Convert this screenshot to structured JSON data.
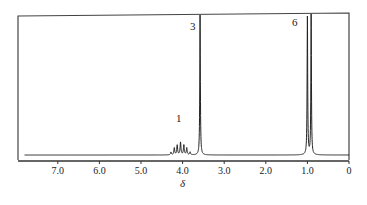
{
  "chart_data": {
    "type": "line",
    "title": "",
    "xlabel": "δ",
    "ylabel": "",
    "xlim": [
      7.8,
      0
    ],
    "x_reversed": true,
    "grid": false,
    "legend": null,
    "x_ticks": [
      "7.0",
      "6.0",
      "5.0",
      "4.0",
      "3.0",
      "2.0",
      "1.0",
      "0"
    ],
    "x_tick_values": [
      7.0,
      6.0,
      5.0,
      4.0,
      3.0,
      2.0,
      1.0,
      0
    ],
    "peaks": [
      {
        "label": "1",
        "shift": 4.05,
        "multiplicity": "septet",
        "integration": 1,
        "lines": [
          {
            "x": 4.28,
            "h": 0.02
          },
          {
            "x": 4.2,
            "h": 0.05
          },
          {
            "x": 4.13,
            "h": 0.07
          },
          {
            "x": 4.05,
            "h": 0.09
          },
          {
            "x": 3.97,
            "h": 0.07
          },
          {
            "x": 3.9,
            "h": 0.05
          },
          {
            "x": 3.82,
            "h": 0.02
          }
        ]
      },
      {
        "label": "3",
        "shift": 3.58,
        "multiplicity": "singlet",
        "integration": 3,
        "lines": [
          {
            "x": 3.58,
            "h": 1.0
          }
        ]
      },
      {
        "label": "6",
        "shift": 0.95,
        "multiplicity": "doublet",
        "integration": 6,
        "lines": [
          {
            "x": 1.0,
            "h": 1.0
          },
          {
            "x": 0.91,
            "h": 1.0
          }
        ]
      }
    ]
  },
  "labels": {
    "axis_symbol": "δ",
    "peak_1": "1",
    "peak_3": "3",
    "peak_6": "6"
  },
  "ticks": [
    "7.0",
    "6.0",
    "5.0",
    "4.0",
    "3.0",
    "2.0",
    "1.0",
    "0"
  ]
}
